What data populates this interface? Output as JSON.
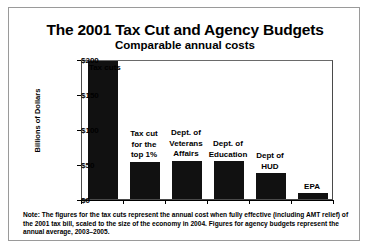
{
  "chart_data": {
    "type": "bar",
    "title": "The 2001 Tax Cut and Agency Budgets",
    "subtitle": "Comparable annual costs",
    "xlabel": "",
    "ylabel": "Billions of Dollars",
    "ylim": [
      0,
      200
    ],
    "yticks": [
      "$0",
      "$50",
      "$100",
      "$150",
      "$200"
    ],
    "ytick_values": [
      0,
      50,
      100,
      150,
      200
    ],
    "grid": false,
    "legend": "none",
    "bar_color": "#111111",
    "categories": [
      "Tax cuts",
      "Tax cut for the top 1%",
      "Dept. of Veterans Affairs",
      "Dept. of Education",
      "Dept of HUD",
      "EPA"
    ],
    "category_labels": [
      "Tax cuts",
      "Tax cut\nfor the\ntop 1%",
      "Dept. of\nVeterans\nAffairs",
      "Dept. of\nEducation",
      "Dept of\nHUD",
      "EPA"
    ],
    "values": [
      197,
      53,
      55,
      54,
      37,
      8
    ],
    "note": "Note: The figures for the tax cuts represent the annual cost when fully effective (including AMT relief) of the 2001 tax bill, scaled to the size of the economy in 2004. Figures for agency budgets represent the annual average, 2003–2005."
  }
}
